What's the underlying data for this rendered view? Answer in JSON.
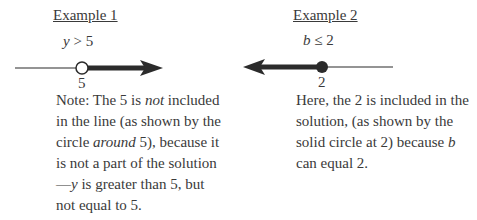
{
  "example1": {
    "title": "Example 1",
    "inequality": {
      "variable": "y",
      "operator": " > ",
      "value": "5"
    },
    "point_label": "5",
    "circle": "open",
    "direction": "right",
    "note": {
      "p1": "Note: The 5 is ",
      "em1": "not",
      "p2": " included in the line (as shown by the circle ",
      "em2": "around",
      "p3": " 5), because it is not a part of the solution—",
      "em3": "y",
      "p4": " is greater than 5, but not equal to 5."
    }
  },
  "example2": {
    "title": "Example 2",
    "inequality": {
      "variable": "b",
      "operator": " ≤ ",
      "value": "2"
    },
    "point_label": "2",
    "circle": "solid",
    "direction": "left",
    "note": {
      "p1": "Here, the 2 is included in the solution, (as shown by the solid circle at 2) because ",
      "em1": "b",
      "p2": " can equal 2."
    }
  },
  "colors": {
    "ink": "#2b2b2b",
    "text": "#3a3a3a"
  }
}
